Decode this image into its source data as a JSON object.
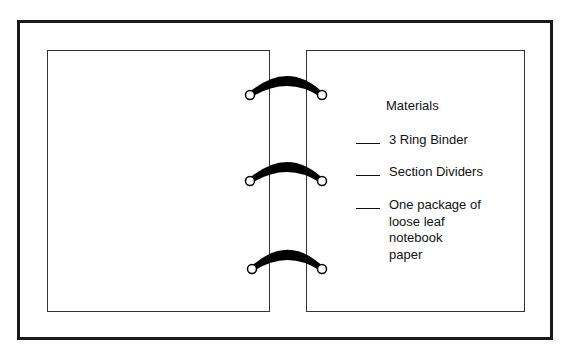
{
  "diagram": {
    "rings_count": 3,
    "checklist": {
      "title": "Materials",
      "items": [
        {
          "label": "3 Ring Binder"
        },
        {
          "label": "Section Dividers"
        },
        {
          "label": "One package of\nloose leaf\nnotebook\npaper"
        }
      ]
    }
  }
}
